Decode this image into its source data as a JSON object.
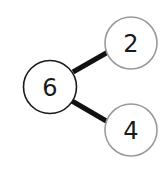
{
  "diagram": {
    "type": "number-bond",
    "whole": {
      "label": "6",
      "cx": 50,
      "cy": 87,
      "r": 27,
      "stroke": "#1a1a1a"
    },
    "parts": [
      {
        "label": "2",
        "cx": 131,
        "cy": 43,
        "r": 26,
        "stroke": "#9a9a9a"
      },
      {
        "label": "4",
        "cx": 131,
        "cy": 130,
        "r": 26,
        "stroke": "#9a9a9a"
      }
    ],
    "connector_color": "#111111"
  }
}
